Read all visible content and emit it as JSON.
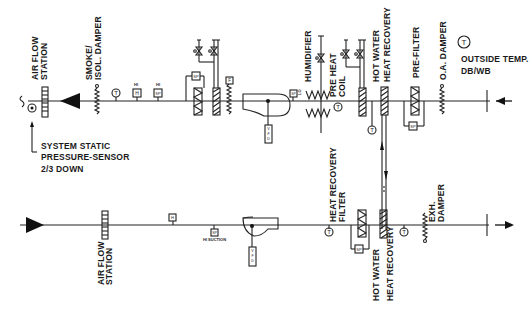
{
  "diagram": {
    "type": "HVAC air handling unit schematic with heat recovery",
    "supply_duct": {
      "flow_direction": "right-to-left",
      "components": [
        {
          "id": "supply-airflow-station",
          "label": [
            "AIR FLOW",
            "STATION"
          ]
        },
        {
          "id": "smoke-isol-damper",
          "label": [
            "SMOKE/",
            "ISOL. DAMPER"
          ]
        },
        {
          "id": "supply-temp-sensor",
          "symbol": "T"
        },
        {
          "id": "humidity-sensor",
          "symbol": "H"
        },
        {
          "id": "static-pressure-sensor",
          "symbol": "SP"
        },
        {
          "id": "final-filter",
          "symbol": "SP"
        },
        {
          "id": "cooling-coil"
        },
        {
          "id": "freeze-stat",
          "symbol": "F"
        },
        {
          "id": "supply-fan",
          "vfd": "VFD"
        },
        {
          "id": "lo-static",
          "symbol": "LO",
          "box": "SP"
        },
        {
          "id": "humidifier",
          "label": [
            "HUMIDIFIER"
          ]
        },
        {
          "id": "preheat-coil",
          "label": [
            "PRE HEAT",
            "COIL"
          ]
        },
        {
          "id": "hw-heat-recovery-supply",
          "label": [
            "HOT WATER",
            "HEAT RECOVERY"
          ]
        },
        {
          "id": "pre-filter",
          "label": [
            "PRE-FILTER"
          ],
          "box": "SP"
        },
        {
          "id": "oa-damper",
          "label": [
            "O.A. DAMPER"
          ]
        }
      ]
    },
    "outside_air": {
      "symbol": "T",
      "label": [
        "OUTSIDE TEMP.",
        "DB/WB"
      ]
    },
    "system_static": {
      "label": [
        "SYSTEM STATIC",
        "PRESSURE-SENSOR",
        "2/3 DOWN"
      ],
      "symbol": "SP"
    },
    "return_duct": {
      "flow_direction": "left-to-right",
      "components": [
        {
          "id": "return-airflow-station",
          "label": [
            "AIR FLOW",
            "STATION"
          ]
        },
        {
          "id": "return-sensor",
          "symbol": "H"
        },
        {
          "id": "hi-suction",
          "box": "SP",
          "label": "HI SUCTION"
        },
        {
          "id": "return-fan",
          "vfd": "VFD"
        },
        {
          "id": "return-temp-sensor",
          "symbol": "T"
        },
        {
          "id": "hr-filter",
          "label": [
            "HEAT RECOVERY",
            "FILTER"
          ],
          "box": "SP"
        },
        {
          "id": "hw-heat-recovery-exhaust",
          "label": [
            "HOT WATER",
            "HEAT RECOVERY"
          ]
        },
        {
          "id": "exhaust-temp-sensor",
          "symbol": "T"
        },
        {
          "id": "exh-damper",
          "label": [
            "EXH.",
            "DAMPER"
          ]
        }
      ]
    },
    "symbols": {
      "T": "T",
      "H": "H",
      "SP": "SP",
      "F": "F",
      "LO": "LO",
      "VFD": [
        "V",
        "F",
        "D"
      ],
      "HI": "HI"
    },
    "labels": {
      "air_flow_station_top": [
        "AIR FLOW",
        "STATION"
      ],
      "smoke_damper": [
        "SMOKE/",
        "ISOL. DAMPER"
      ],
      "humidifier": "HUMIDIFIER",
      "preheat": [
        "PRE HEAT",
        "COIL"
      ],
      "hw_hr_top": [
        "HOT WATER",
        "HEAT RECOVERY"
      ],
      "prefilter": "PRE-FILTER",
      "oa_damper": "O.A. DAMPER",
      "outside_temp": [
        "OUTSIDE TEMP.",
        "DB/WB"
      ],
      "system_static": [
        "SYSTEM STATIC",
        "PRESSURE-SENSOR",
        "2/3 DOWN"
      ],
      "air_flow_station_bottom": [
        "AIR FLOW",
        "STATION"
      ],
      "hi_suction": "HI SUCTION",
      "hr_filter": [
        "HEAT RECOVERY",
        "FILTER"
      ],
      "hw_hr_bottom": [
        "HOT WATER",
        "HEAT RECOVERY"
      ],
      "exh_damper": [
        "EXH.",
        "DAMPER"
      ]
    },
    "colors": {
      "line": "#222222",
      "background": "#ffffff",
      "text": "#1a1a1a"
    }
  }
}
